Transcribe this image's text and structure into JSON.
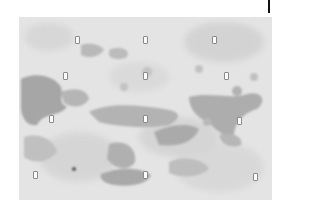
{
  "image": {
    "description": "grayscale mottled stained texture with grid of small white rectangular markers",
    "background_color": "#e6e6e6",
    "stain_colors": [
      "#c9c9c9",
      "#b8b8b8",
      "#a9a9a9",
      "#9a9a9a"
    ],
    "markers": [
      {
        "row": 1,
        "x": 77,
        "y": 40
      },
      {
        "row": 1,
        "x": 145,
        "y": 40
      },
      {
        "row": 1,
        "x": 214,
        "y": 40
      },
      {
        "row": 2,
        "x": 65,
        "y": 76
      },
      {
        "row": 2,
        "x": 145,
        "y": 76
      },
      {
        "row": 2,
        "x": 226,
        "y": 76
      },
      {
        "row": 3,
        "x": 51,
        "y": 119
      },
      {
        "row": 3,
        "x": 145,
        "y": 119
      },
      {
        "row": 3,
        "x": 239,
        "y": 121
      },
      {
        "row": 4,
        "x": 35,
        "y": 175
      },
      {
        "row": 4,
        "x": 145,
        "y": 175
      },
      {
        "row": 4,
        "x": 255,
        "y": 177
      }
    ]
  }
}
